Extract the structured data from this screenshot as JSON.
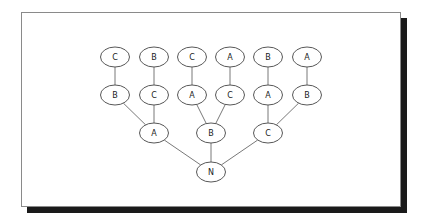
{
  "diagram": {
    "type": "tree",
    "root": "n0",
    "nodes": [
      {
        "id": "n0",
        "label": "N",
        "x": 211,
        "y": 172
      },
      {
        "id": "n1",
        "label": "A",
        "x": 154,
        "y": 133
      },
      {
        "id": "n2",
        "label": "B",
        "x": 211,
        "y": 133
      },
      {
        "id": "n3",
        "label": "C",
        "x": 268,
        "y": 133
      },
      {
        "id": "n4",
        "label": "B",
        "x": 115,
        "y": 95
      },
      {
        "id": "n5",
        "label": "C",
        "x": 154,
        "y": 95
      },
      {
        "id": "n6",
        "label": "A",
        "x": 192,
        "y": 95
      },
      {
        "id": "n7",
        "label": "C",
        "x": 230,
        "y": 95
      },
      {
        "id": "n8",
        "label": "A",
        "x": 268,
        "y": 95
      },
      {
        "id": "n9",
        "label": "B",
        "x": 307,
        "y": 95
      },
      {
        "id": "n10",
        "label": "C",
        "x": 115,
        "y": 57
      },
      {
        "id": "n11",
        "label": "B",
        "x": 154,
        "y": 57
      },
      {
        "id": "n12",
        "label": "C",
        "x": 192,
        "y": 57
      },
      {
        "id": "n13",
        "label": "A",
        "x": 230,
        "y": 57
      },
      {
        "id": "n14",
        "label": "B",
        "x": 268,
        "y": 57
      },
      {
        "id": "n15",
        "label": "A",
        "x": 307,
        "y": 57
      }
    ],
    "edges": [
      {
        "from": "n0",
        "to": "n1"
      },
      {
        "from": "n0",
        "to": "n2"
      },
      {
        "from": "n0",
        "to": "n3"
      },
      {
        "from": "n1",
        "to": "n4"
      },
      {
        "from": "n1",
        "to": "n5"
      },
      {
        "from": "n2",
        "to": "n6"
      },
      {
        "from": "n2",
        "to": "n7"
      },
      {
        "from": "n3",
        "to": "n8"
      },
      {
        "from": "n3",
        "to": "n9"
      },
      {
        "from": "n4",
        "to": "n10"
      },
      {
        "from": "n5",
        "to": "n11"
      },
      {
        "from": "n6",
        "to": "n12"
      },
      {
        "from": "n7",
        "to": "n13"
      },
      {
        "from": "n8",
        "to": "n14"
      },
      {
        "from": "n9",
        "to": "n15"
      }
    ],
    "node_rx": 14.5,
    "node_ry": 10
  }
}
